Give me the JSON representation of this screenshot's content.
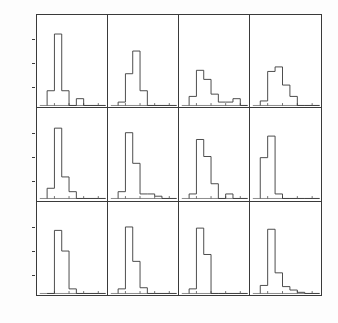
{
  "figure": {
    "y_axis_unit": "%",
    "y_ticks": [
      "20",
      "40",
      "60"
    ],
    "x_ticks": [
      "10",
      "20",
      "30",
      "40"
    ],
    "x_unit": "sec"
  },
  "chart_data": {
    "type": "bar",
    "title": "",
    "xlabel": "sec",
    "ylabel": "%",
    "xlim": [
      0,
      45
    ],
    "ylim": [
      0,
      70
    ],
    "bin_width": 5,
    "grid": false,
    "legend": "none",
    "panels": [
      {
        "label": "A",
        "n_label": "n = 50",
        "n": 50,
        "bin_starts": [
          5,
          10,
          15,
          20,
          25,
          30,
          35,
          40
        ],
        "values": [
          13,
          63,
          13,
          0,
          6,
          0,
          0,
          0
        ]
      },
      {
        "label": "B",
        "n_label": "n = 40",
        "n": 40,
        "bin_starts": [
          5,
          10,
          15,
          20,
          25,
          30,
          35,
          40
        ],
        "values": [
          3,
          28,
          48,
          13,
          0,
          0,
          0,
          0
        ]
      },
      {
        "label": "C",
        "n_label": "n = 52",
        "n": 52,
        "bin_starts": [
          5,
          10,
          15,
          20,
          25,
          30,
          35,
          40
        ],
        "values": [
          8,
          31,
          23,
          10,
          3,
          3,
          6,
          0
        ]
      },
      {
        "label": "D",
        "n_label": "n = 50",
        "n": 50,
        "bin_starts": [
          5,
          10,
          15,
          20,
          25,
          30,
          35,
          40
        ],
        "values": [
          4,
          30,
          34,
          18,
          8,
          0,
          0,
          0
        ]
      },
      {
        "label": "E",
        "n_label": "n = 78",
        "n": 78,
        "bin_starts": [
          5,
          10,
          15,
          20,
          25,
          30,
          35,
          40
        ],
        "values": [
          9,
          62,
          19,
          6,
          0,
          0,
          0,
          0
        ]
      },
      {
        "label": "F",
        "n_label": "n = 50",
        "n": 50,
        "bin_starts": [
          5,
          10,
          15,
          20,
          25,
          30,
          35,
          40
        ],
        "values": [
          6,
          58,
          31,
          4,
          4,
          2,
          0,
          0
        ]
      },
      {
        "label": "G",
        "n_label": "n = 50",
        "n": 50,
        "bin_starts": [
          5,
          10,
          15,
          20,
          25,
          30,
          35,
          40
        ],
        "values": [
          4,
          52,
          37,
          13,
          0,
          4,
          0,
          0
        ]
      },
      {
        "label": "H",
        "n_label": "n = 50",
        "n": 50,
        "bin_starts": [
          5,
          10,
          15,
          20,
          25,
          30,
          35,
          40
        ],
        "values": [
          36,
          55,
          4,
          0,
          0,
          0,
          0,
          0
        ]
      },
      {
        "label": "I",
        "n_label": "n = 39",
        "n": 39,
        "bin_starts": [
          5,
          10,
          15,
          20,
          25,
          30,
          35,
          40
        ],
        "values": [
          0,
          55,
          37,
          4,
          0,
          0,
          0,
          0
        ]
      },
      {
        "label": "J",
        "n_label": "n = 139",
        "n": 139,
        "bin_starts": [
          5,
          10,
          15,
          20,
          25,
          30,
          35,
          40
        ],
        "values": [
          4,
          58,
          28,
          5,
          0,
          0,
          0,
          0
        ]
      },
      {
        "label": "K",
        "n_label": "n = 26",
        "n": 26,
        "bin_starts": [
          5,
          10,
          15,
          20,
          25,
          30,
          35,
          40
        ],
        "values": [
          4,
          57,
          34,
          0,
          0,
          0,
          0,
          0
        ]
      },
      {
        "label": "L",
        "n_label": "n = 100",
        "n": 100,
        "bin_starts": [
          5,
          10,
          15,
          20,
          25,
          30,
          35,
          40
        ],
        "values": [
          7,
          56,
          18,
          6,
          3,
          1,
          0,
          0
        ]
      }
    ]
  }
}
